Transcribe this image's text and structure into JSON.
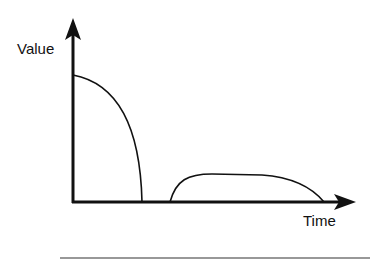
{
  "diagram": {
    "y_axis_label": "Value",
    "x_axis_label": "Time",
    "curves": [
      {
        "name": "decay-curve",
        "description": "starts high at origin, falls to zero"
      },
      {
        "name": "plateau-curve",
        "description": "rises quickly, flat plateau, falls to zero"
      }
    ],
    "colors": {
      "line": "#111111",
      "background": "#ffffff"
    }
  }
}
